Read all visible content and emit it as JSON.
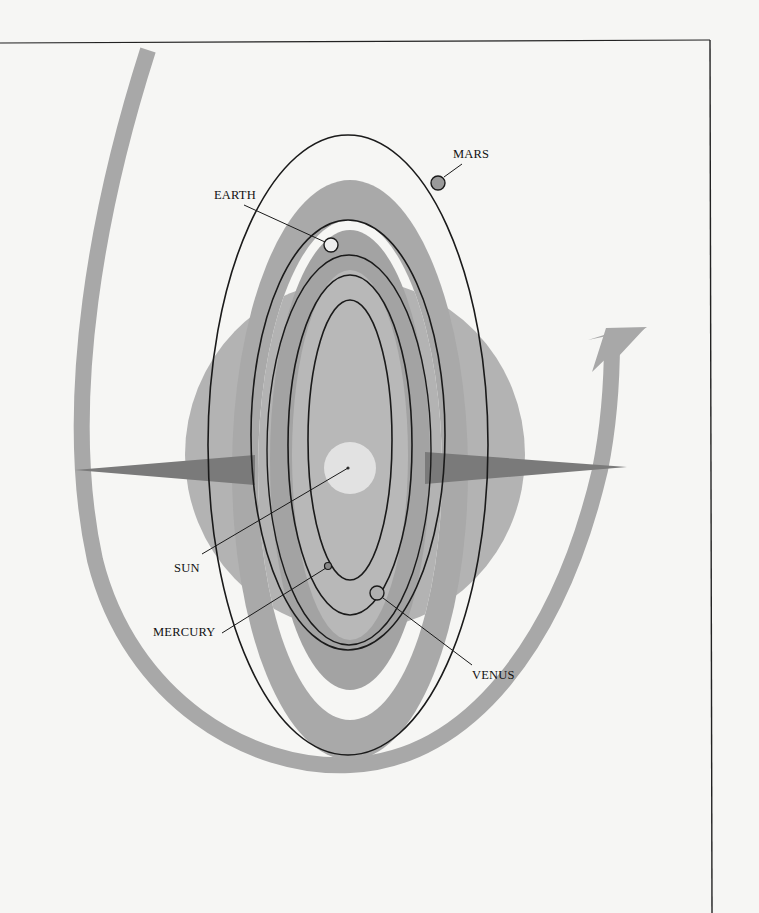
{
  "diagram": {
    "type": "orbital-diagram",
    "labels": {
      "mars": "MARS",
      "earth": "EARTH",
      "sun": "SUN",
      "mercury": "MERCURY",
      "venus": "VENUS"
    },
    "colors": {
      "paper": "#f6f6f4",
      "band": "#a6a6a6",
      "band_light": "#bdbdbd",
      "orbit_line": "#1a1a1a",
      "sun": "#e2e2e2",
      "mars": "#9a9a9a",
      "earth": "#eeeeee"
    }
  }
}
